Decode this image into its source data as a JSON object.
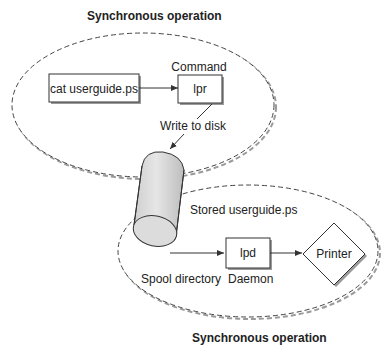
{
  "diagram": {
    "top_group": {
      "title": "Synchronous operation",
      "source_box": "cat userguide.ps",
      "command_label": "Command",
      "command_box": "lpr",
      "edge_label": "Write to disk"
    },
    "storage": {
      "label": "Stored userguide.ps"
    },
    "bottom_group": {
      "title": "Synchronous operation",
      "spool_label": "Spool directory",
      "daemon_box": "lpd",
      "daemon_label": "Daemon",
      "printer": "Printer"
    },
    "colors": {
      "stroke": "#333333",
      "cylinder_fill": "#d9d9d9",
      "shadow": "#9a9a9a"
    }
  }
}
